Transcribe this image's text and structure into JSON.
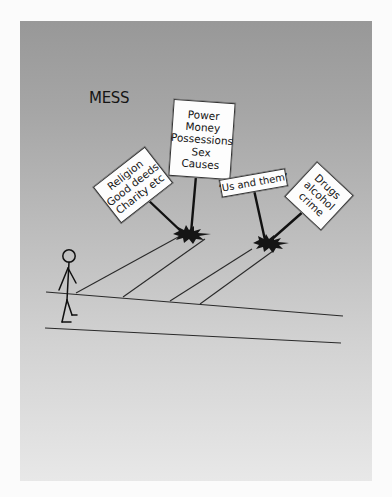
{
  "diagram": {
    "title": "MESS",
    "colors": {
      "page_background": "#fbfbfb",
      "panel_gradient_top": "#989898",
      "panel_gradient_bottom": "#e8e8e8",
      "sign_fill": "#fdfdfd",
      "ink": "#151515"
    },
    "signs": [
      {
        "id": "religion",
        "lines": [
          "Religion",
          "Good deeds",
          "Charity etc"
        ]
      },
      {
        "id": "power",
        "lines": [
          "Power",
          "Money",
          "Possessions",
          "Sex",
          "Causes"
        ]
      },
      {
        "id": "us-and-them",
        "lines": [
          "‘Us and them’"
        ]
      },
      {
        "id": "drugs",
        "lines": [
          "Drugs",
          "alcohol",
          "crime"
        ]
      }
    ],
    "figure": {
      "label": "stick-figure-person"
    }
  }
}
